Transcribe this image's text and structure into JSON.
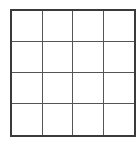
{
  "grid": {
    "rows": 4,
    "columns": 4,
    "line_color": "#555555",
    "border_color": "#3a3a3a",
    "cell_fill": "#ffffff"
  }
}
